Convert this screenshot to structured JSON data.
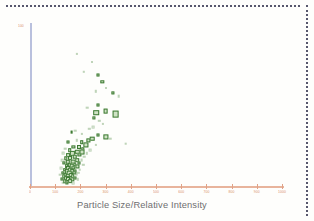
{
  "page": {
    "background_color": "#fefefc",
    "border_style": "dotted",
    "border_color": "#3b3b55"
  },
  "axes": {
    "y_axis_color": "#b9c0dd",
    "x_axis_color": "#e8b49c",
    "tick_label_color": "#d98b63",
    "title_color": "#6e6e70",
    "y_axis_label": "100"
  },
  "chart_data": {
    "type": "scatter",
    "title": "",
    "xlabel": "Particle Size/Relative Intensity",
    "ylabel": "",
    "marker_color": "#3e7a34",
    "marker_fill": "#cfe3c4",
    "marker_shape": "square",
    "grid": false,
    "legend": "none",
    "xlim": [
      0,
      1000
    ],
    "ylim": [
      0,
      100
    ],
    "xticks": [
      0,
      100,
      200,
      300,
      400,
      500,
      600,
      700,
      800,
      900,
      1000
    ],
    "xtick_labels": [
      "0",
      "100",
      "200",
      "300",
      "400",
      "500",
      "600",
      "700",
      "800",
      "900",
      "1000"
    ],
    "yticks": [
      100
    ],
    "ytick_labels": [
      "100"
    ],
    "points": [
      {
        "x": 186,
        "y": 81,
        "size": 2.2,
        "faint": true
      },
      {
        "x": 245,
        "y": 76,
        "size": 1.8,
        "faint": true
      },
      {
        "x": 213,
        "y": 70,
        "size": 2.4,
        "faint": true
      },
      {
        "x": 268,
        "y": 68,
        "size": 3.0,
        "faint": false
      },
      {
        "x": 287,
        "y": 64,
        "size": 3.4,
        "faint": false
      },
      {
        "x": 300,
        "y": 60,
        "size": 2.0,
        "faint": true
      },
      {
        "x": 262,
        "y": 58,
        "size": 2.4,
        "faint": true
      },
      {
        "x": 330,
        "y": 57,
        "size": 3.2,
        "faint": false
      },
      {
        "x": 352,
        "y": 55,
        "size": 2.6,
        "faint": true
      },
      {
        "x": 268,
        "y": 50,
        "size": 3.0,
        "faint": false
      },
      {
        "x": 228,
        "y": 48,
        "size": 2.6,
        "faint": true
      },
      {
        "x": 300,
        "y": 46,
        "size": 4.8,
        "faint": false
      },
      {
        "x": 262,
        "y": 45,
        "size": 5.6,
        "faint": false
      },
      {
        "x": 340,
        "y": 44,
        "size": 6.8,
        "faint": false
      },
      {
        "x": 255,
        "y": 42,
        "size": 3.2,
        "faint": false
      },
      {
        "x": 275,
        "y": 40,
        "size": 2.4,
        "faint": true
      },
      {
        "x": 290,
        "y": 38,
        "size": 2.2,
        "faint": true
      },
      {
        "x": 250,
        "y": 36,
        "size": 2.8,
        "faint": true
      },
      {
        "x": 236,
        "y": 35,
        "size": 2.4,
        "faint": true
      },
      {
        "x": 180,
        "y": 34,
        "size": 2.6,
        "faint": true
      },
      {
        "x": 165,
        "y": 33,
        "size": 2.8,
        "faint": false
      },
      {
        "x": 205,
        "y": 32,
        "size": 2.2,
        "faint": true
      },
      {
        "x": 268,
        "y": 31,
        "size": 3.0,
        "faint": false
      },
      {
        "x": 300,
        "y": 30,
        "size": 5.2,
        "faint": false
      },
      {
        "x": 318,
        "y": 29,
        "size": 2.6,
        "faint": true
      },
      {
        "x": 248,
        "y": 29,
        "size": 4.6,
        "faint": false
      },
      {
        "x": 232,
        "y": 28,
        "size": 3.2,
        "faint": false
      },
      {
        "x": 186,
        "y": 28,
        "size": 2.4,
        "faint": true
      },
      {
        "x": 150,
        "y": 27,
        "size": 3.0,
        "faint": false
      },
      {
        "x": 205,
        "y": 27,
        "size": 3.6,
        "faint": false
      },
      {
        "x": 380,
        "y": 26,
        "size": 2.6,
        "faint": true
      },
      {
        "x": 262,
        "y": 25,
        "size": 2.2,
        "faint": true
      },
      {
        "x": 222,
        "y": 25,
        "size": 5.2,
        "faint": false
      },
      {
        "x": 196,
        "y": 24,
        "size": 4.0,
        "faint": false
      },
      {
        "x": 172,
        "y": 24,
        "size": 3.2,
        "faint": false
      },
      {
        "x": 140,
        "y": 23,
        "size": 2.6,
        "faint": true
      },
      {
        "x": 210,
        "y": 23,
        "size": 3.4,
        "faint": false
      },
      {
        "x": 240,
        "y": 22,
        "size": 2.8,
        "faint": true
      },
      {
        "x": 158,
        "y": 22,
        "size": 3.6,
        "faint": false
      },
      {
        "x": 188,
        "y": 21,
        "size": 4.4,
        "faint": false
      },
      {
        "x": 205,
        "y": 21,
        "size": 5.0,
        "faint": false
      },
      {
        "x": 225,
        "y": 20,
        "size": 2.4,
        "faint": true
      },
      {
        "x": 132,
        "y": 20,
        "size": 2.8,
        "faint": true
      },
      {
        "x": 168,
        "y": 20,
        "size": 4.2,
        "faint": false
      },
      {
        "x": 150,
        "y": 19,
        "size": 3.8,
        "faint": false
      },
      {
        "x": 196,
        "y": 19,
        "size": 3.2,
        "faint": false
      },
      {
        "x": 215,
        "y": 18,
        "size": 2.6,
        "faint": true
      },
      {
        "x": 178,
        "y": 18,
        "size": 4.6,
        "faint": false
      },
      {
        "x": 142,
        "y": 17,
        "size": 3.4,
        "faint": false
      },
      {
        "x": 160,
        "y": 17,
        "size": 4.0,
        "faint": false
      },
      {
        "x": 188,
        "y": 16,
        "size": 3.6,
        "faint": false
      },
      {
        "x": 205,
        "y": 16,
        "size": 2.8,
        "faint": true
      },
      {
        "x": 128,
        "y": 16,
        "size": 2.6,
        "faint": true
      },
      {
        "x": 150,
        "y": 15,
        "size": 4.4,
        "faint": false
      },
      {
        "x": 170,
        "y": 15,
        "size": 4.8,
        "faint": false
      },
      {
        "x": 196,
        "y": 14,
        "size": 3.0,
        "faint": false
      },
      {
        "x": 136,
        "y": 14,
        "size": 3.2,
        "faint": false
      },
      {
        "x": 158,
        "y": 13,
        "size": 4.2,
        "faint": false
      },
      {
        "x": 178,
        "y": 13,
        "size": 3.6,
        "faint": false
      },
      {
        "x": 212,
        "y": 13,
        "size": 2.4,
        "faint": true
      },
      {
        "x": 145,
        "y": 12,
        "size": 3.8,
        "faint": false
      },
      {
        "x": 165,
        "y": 12,
        "size": 4.6,
        "faint": false
      },
      {
        "x": 188,
        "y": 12,
        "size": 3.2,
        "faint": false
      },
      {
        "x": 124,
        "y": 11,
        "size": 2.8,
        "faint": true
      },
      {
        "x": 152,
        "y": 11,
        "size": 4.0,
        "faint": false
      },
      {
        "x": 172,
        "y": 11,
        "size": 3.4,
        "faint": false
      },
      {
        "x": 198,
        "y": 10,
        "size": 2.6,
        "faint": true
      },
      {
        "x": 138,
        "y": 10,
        "size": 3.6,
        "faint": false
      },
      {
        "x": 160,
        "y": 10,
        "size": 4.4,
        "faint": false
      },
      {
        "x": 180,
        "y": 9,
        "size": 3.0,
        "faint": false
      },
      {
        "x": 146,
        "y": 9,
        "size": 4.2,
        "faint": false
      },
      {
        "x": 166,
        "y": 9,
        "size": 3.8,
        "faint": false
      },
      {
        "x": 130,
        "y": 8,
        "size": 3.2,
        "faint": false
      },
      {
        "x": 155,
        "y": 8,
        "size": 4.6,
        "faint": false
      },
      {
        "x": 176,
        "y": 8,
        "size": 3.4,
        "faint": false
      },
      {
        "x": 192,
        "y": 8,
        "size": 2.4,
        "faint": true
      },
      {
        "x": 140,
        "y": 7,
        "size": 3.8,
        "faint": false
      },
      {
        "x": 162,
        "y": 7,
        "size": 4.0,
        "faint": false
      },
      {
        "x": 184,
        "y": 7,
        "size": 2.8,
        "faint": true
      },
      {
        "x": 120,
        "y": 7,
        "size": 2.6,
        "faint": true
      },
      {
        "x": 150,
        "y": 6,
        "size": 4.4,
        "faint": false
      },
      {
        "x": 170,
        "y": 6,
        "size": 3.6,
        "faint": false
      },
      {
        "x": 134,
        "y": 6,
        "size": 3.4,
        "faint": false
      },
      {
        "x": 158,
        "y": 5,
        "size": 4.2,
        "faint": false
      },
      {
        "x": 178,
        "y": 5,
        "size": 3.0,
        "faint": false
      },
      {
        "x": 144,
        "y": 5,
        "size": 3.8,
        "faint": false
      },
      {
        "x": 126,
        "y": 4,
        "size": 3.0,
        "faint": false
      },
      {
        "x": 152,
        "y": 4,
        "size": 4.0,
        "faint": false
      },
      {
        "x": 168,
        "y": 4,
        "size": 3.4,
        "faint": false
      },
      {
        "x": 190,
        "y": 4,
        "size": 2.4,
        "faint": true
      },
      {
        "x": 138,
        "y": 3,
        "size": 3.6,
        "faint": false
      },
      {
        "x": 160,
        "y": 3,
        "size": 3.8,
        "faint": false
      },
      {
        "x": 148,
        "y": 2,
        "size": 3.2,
        "faint": false
      },
      {
        "x": 172,
        "y": 2,
        "size": 2.8,
        "faint": true
      },
      {
        "x": 132,
        "y": 2,
        "size": 2.6,
        "faint": true
      }
    ]
  }
}
